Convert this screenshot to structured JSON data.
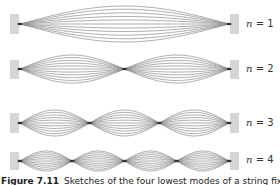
{
  "figure": {
    "caption_number": "Figure 7.11",
    "caption_text": "Sketches of the four lowest modes of a string fixed at both ends",
    "colors": {
      "curve": "#8a8a8a",
      "node": "#333333",
      "wall": "#d6d6d6"
    },
    "string": {
      "x_start": 20,
      "x_end": 229
    },
    "rows": [
      {
        "n_label": "n",
        "eq": "= 1",
        "mode": 1,
        "cy": 24,
        "amp": 18,
        "wall_top": 14,
        "wall_h": 20
      },
      {
        "n_label": "n",
        "eq": "= 2",
        "mode": 2,
        "cy": 69,
        "amp": 14,
        "wall_top": 60,
        "wall_h": 19
      },
      {
        "n_label": "n",
        "eq": "= 3",
        "mode": 3,
        "cy": 123,
        "amp": 13,
        "wall_top": 113,
        "wall_h": 20
      },
      {
        "n_label": "n",
        "eq": "= 4",
        "mode": 4,
        "cy": 161,
        "amp": 10,
        "wall_top": 152,
        "wall_h": 18
      }
    ]
  }
}
